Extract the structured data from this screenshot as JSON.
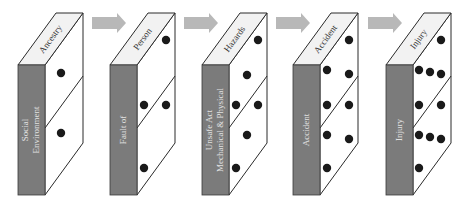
{
  "diagram": {
    "colors": {
      "front_face": "#7b7b7b",
      "top_face": "#f2f2f2",
      "side_face": "#ffffff",
      "dot": "#1a1a1a",
      "arrow": "#b8b8b8"
    },
    "dominoes": [
      {
        "id": "ancestry",
        "top_label": "Ancestry",
        "front_label_lines": [
          "Social",
          "Environment"
        ],
        "x": 18,
        "dots": [
          [
            61,
            73
          ],
          [
            61,
            133
          ]
        ]
      },
      {
        "id": "person",
        "top_label": "Person",
        "front_label_lines": [
          "Fault of"
        ],
        "x": 110,
        "dots": [
          [
            166,
            40
          ],
          [
            144,
            105
          ],
          [
            166,
            105
          ],
          [
            144,
            168
          ]
        ]
      },
      {
        "id": "hazards",
        "top_label": "Hazards",
        "front_label_lines": [
          "Unsafe Act",
          "Mechanical & Physical"
        ],
        "x": 202,
        "dots": [
          [
            258,
            40
          ],
          [
            247,
            75
          ],
          [
            236,
            105
          ],
          [
            258,
            105
          ],
          [
            247,
            135
          ],
          [
            236,
            168
          ]
        ]
      },
      {
        "id": "accident",
        "top_label": "Accident",
        "front_label_lines": [
          "Accident"
        ],
        "x": 293,
        "dots": [
          [
            349,
            40
          ],
          [
            327,
            70
          ],
          [
            349,
            74
          ],
          [
            327,
            105
          ],
          [
            349,
            105
          ],
          [
            327,
            135
          ],
          [
            349,
            139
          ],
          [
            327,
            168
          ]
        ]
      },
      {
        "id": "injury",
        "top_label": "Injury",
        "front_label_lines": [
          "Injury"
        ],
        "x": 386,
        "dots": [
          [
            441,
            40
          ],
          [
            419,
            70
          ],
          [
            430,
            72
          ],
          [
            441,
            74
          ],
          [
            419,
            105
          ],
          [
            441,
            105
          ],
          [
            419,
            135
          ],
          [
            430,
            137
          ],
          [
            441,
            139
          ],
          [
            419,
            168
          ]
        ]
      }
    ],
    "arrows": [
      {
        "x": 92,
        "y": 23
      },
      {
        "x": 184,
        "y": 23
      },
      {
        "x": 276,
        "y": 23
      },
      {
        "x": 368,
        "y": 23
      }
    ]
  }
}
